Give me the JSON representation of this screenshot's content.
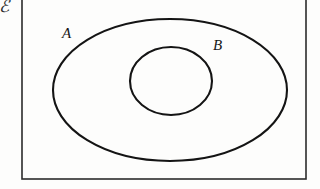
{
  "figure": {
    "type": "euler-diagram",
    "background_color": "#fdfdfc",
    "stroke_color": "#141414"
  },
  "labels": {
    "universal_set": "ℰ",
    "outer_set": "A",
    "inner_set": "B"
  },
  "shapes": {
    "universal_rectangle": {
      "name": "universal-set-rectangle",
      "x": 22,
      "y": -6,
      "width": 284,
      "height": 185,
      "stroke_width": 1.6
    },
    "outer_ellipse": {
      "name": "set-a-ellipse",
      "cx": 170,
      "cy": 90,
      "rx": 117,
      "ry": 71,
      "stroke_width": 2.1
    },
    "inner_ellipse": {
      "name": "set-b-ellipse",
      "cx": 171,
      "cy": 81,
      "rx": 41,
      "ry": 34,
      "stroke_width": 2.1
    }
  }
}
